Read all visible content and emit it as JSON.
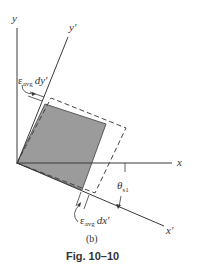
{
  "figure": {
    "axes": {
      "y": "y",
      "y_prime": "y'",
      "x": "x",
      "x_prime": "x'"
    },
    "annotations": {
      "strain_dy": {
        "epsilon": "ε",
        "subscript": "avg",
        "differential": "dy'"
      },
      "strain_dx": {
        "epsilon": "ε",
        "subscript": "avg",
        "differential": "dx'"
      },
      "angle": {
        "symbol": "θ",
        "subscript": "s1"
      }
    },
    "sublabel": "(b)",
    "caption": "Fig. 10–10",
    "colors": {
      "line": "#3a3a3a",
      "square_fill": "#9a9a9a",
      "square_edge": "#555555",
      "dashed": "#444444",
      "background": "#ffffff"
    }
  }
}
